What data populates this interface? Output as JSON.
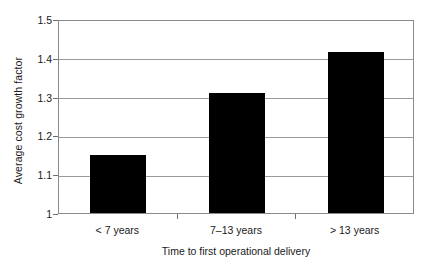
{
  "chart_data": {
    "type": "bar",
    "title": "",
    "categories": [
      "< 7 years",
      "7–13 years",
      "> 13 years"
    ],
    "values": [
      1.15,
      1.31,
      1.415
    ],
    "xlabel": "Time to first operational delivery",
    "ylabel": "Average cost growth factor",
    "ylim": [
      1,
      1.5
    ],
    "ytick_labels": [
      "1.5",
      "1.4",
      "1.3",
      "1.2",
      "1.1",
      "1"
    ],
    "ytick_values": [
      1.5,
      1.4,
      1.3,
      1.2,
      1.1,
      1.0
    ],
    "grid": true,
    "legend": "none",
    "bar_color": "#000000",
    "grid_color": "#9a9a9a",
    "axis_color": "#8a8a8a",
    "background": "#ffffff"
  }
}
